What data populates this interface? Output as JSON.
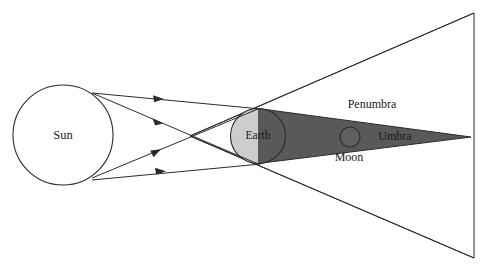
{
  "figure": {
    "width": 480,
    "height": 269,
    "background_color": "#ffffff"
  },
  "colors": {
    "penumbra_fill": "#cdcdcd",
    "umbra_fill": "#595959",
    "outline": "#2b2b2b",
    "text": "#1a1a1a",
    "sun_fill": "#ffffff"
  },
  "labels": {
    "sun": "Sun",
    "earth": "Earth",
    "moon": "Moon",
    "umbra": "Umbra",
    "penumbra": "Penumbra"
  },
  "bodies": {
    "sun": {
      "cx": 63,
      "cy": 135,
      "r": 50,
      "label_x": 63,
      "label_y": 136
    },
    "earth": {
      "cx": 258,
      "cy": 136,
      "r": 27.5,
      "label_x": 258,
      "label_y": 136
    },
    "moon": {
      "cx": 350,
      "cy": 137,
      "r": 10,
      "label_x": 349,
      "label_y": 158
    }
  },
  "label_positions": {
    "umbra": {
      "x": 395,
      "y": 137
    },
    "penumbra": {
      "x": 372,
      "y": 105
    }
  },
  "shadow_geometry": {
    "umbra_apex": {
      "x": 471,
      "y": 137
    },
    "umbra_top_start": {
      "x": 258,
      "y": 108.5
    },
    "umbra_bottom_start": {
      "x": 258,
      "y": 163.5
    },
    "penumbra_crossing": {
      "x": 190,
      "y": 136
    },
    "penumbra_top_right": {
      "x": 474,
      "y": 13
    },
    "penumbra_bottom_right": {
      "x": 474,
      "y": 258
    }
  },
  "rays": [
    {
      "name": "ray-sun-top-to-earth-top",
      "x1": 92,
      "y1": 93,
      "x2": 261,
      "y2": 109,
      "arrow_t": 0.42
    },
    {
      "name": "ray-sun-top-to-earth-bottom",
      "x1": 92,
      "y1": 93,
      "x2": 258,
      "y2": 164,
      "arrow_t": 0.4
    },
    {
      "name": "ray-sun-bottom-to-earth-top",
      "x1": 92,
      "y1": 178,
      "x2": 258,
      "y2": 109,
      "arrow_t": 0.4
    },
    {
      "name": "ray-sun-bottom-to-earth-bot",
      "x1": 92,
      "y1": 180,
      "x2": 261,
      "y2": 164,
      "arrow_t": 0.43
    }
  ]
}
